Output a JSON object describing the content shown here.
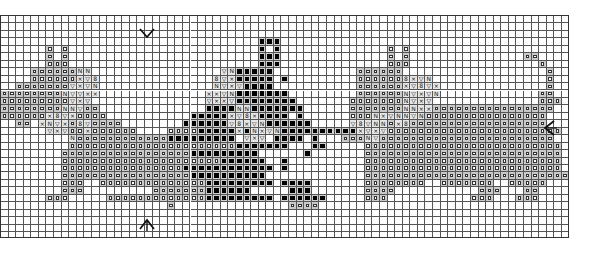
{
  "grid": {
    "columns": 75,
    "rows": 30,
    "cell_width_px": 7.58,
    "cell_height_px": 7.45,
    "line_color": "#555555",
    "background": "#ffffff"
  },
  "legend_symbols": {
    ".": "empty",
    "o": "open-square",
    "#": "filled-square",
    "x": "cross",
    "v": "triangle-down",
    "n": "n-glyph",
    "b": "circle-eight"
  },
  "symbol_glyphs": {
    "x": "×",
    "v": "▽",
    "n": "N",
    "b": "8"
  },
  "colors": {
    "open_square_shade": "#c9c9c9",
    "filled_square": "#000000",
    "filled_square_shade": "#cfcfcf",
    "feature_shade": "#e6e6e6"
  },
  "center_markers": [
    {
      "name": "top-center-arrow",
      "direction": "down",
      "x": 147,
      "y": 26
    },
    {
      "name": "bottom-center-arrow",
      "direction": "up",
      "x": 147,
      "y": 218
    },
    {
      "name": "right-center-arrow",
      "direction": "left",
      "x": 549,
      "y": 127
    }
  ],
  "pattern_rows": [
    "...........................................................................",
    "...........................................................................",
    "...........................................................................",
    "..................................###......................................",
    "......o.o.........................#.#..............o.o.....................",
    "......o.o.........................###..............o.o...............oo....",
    "......ooo.........................###..............ooo.................o...",
    "....oooooonn.................vn#####...........oooooo...................o..",
    "....ooooooxvb...............bvx#####.#.........oooooobxvn...............o..",
    "..ooooooovxvn...............nvxv####...........ooooooxvbvx..............o..",
    "oooooooonvvxx..............xxvn#######.........oooooonvxvn.............oo..",
    "ooooooooovxv...............vxxv########.......ooooooonvxv..............ooo.",
    "oooooooonnvoo..............####nn#######......ooooooonnxxoooooooooooooooo..",
    "ooooooxbvxoooo...........#####xvbx####.#......ooonxvnnvnoooooooooooooooo...",
    "..oo.xnvxobvoooo........######vbxvn######.....vbvnnoxboooooooooooooooooo...",
    "......vxvooxoooooo....oooo#####x#nxvn##########xvxvooooooooooooooooooooooo..",
    ".........noooooooooooo#########.vxv.####.#...ooonvooooooooooooooooooooooo..",
    ".........oooooooooooooooooooooo#######...##.....oooooooooooooooooooooooooo..",
    "........ooooooooooooooooo#########......#.......oooooooooooooooooooooooooo..",
    "........ooooooooooooooooooooo######..#..........oooooooooooooooooooooooooo..",
    "........oooooooooooooooo############.#..........oooooooooooooooooooooooooo..",
    "........ooooooooooooooooo##########.............ooooooooooooooooooooooooooo.",
    "........ooo..oooooooooooooo#########.####.......oooooooo..ooooooo..ooooo....",
    "........ooo.........ooooooo######.....###.......oooo...........ooo...oo.....",
    "......ooo.....ooooooooooooo#########.######.....ooo...........ooo...ooo.....",
    "......................o...............oooo...................................",
    "...........................................................................",
    "...........................................................................",
    "...........................................................................",
    "..........................................................................."
  ]
}
